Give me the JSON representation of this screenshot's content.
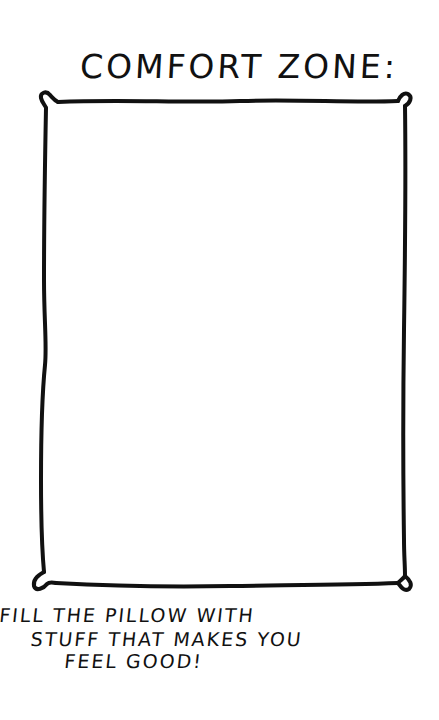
{
  "title": "COMFORT ZONE:",
  "pillow": {
    "description": "hand-drawn empty pillow outline to fill in",
    "stroke_color": "#111111",
    "fill_color": "#ffffff"
  },
  "caption": {
    "lines": [
      "FILL THE PILLOW WITH",
      "STUFF THAT MAKES YOU",
      "FEEL GOOD!"
    ]
  },
  "colors": {
    "background": "#ffffff",
    "ink": "#111111"
  }
}
